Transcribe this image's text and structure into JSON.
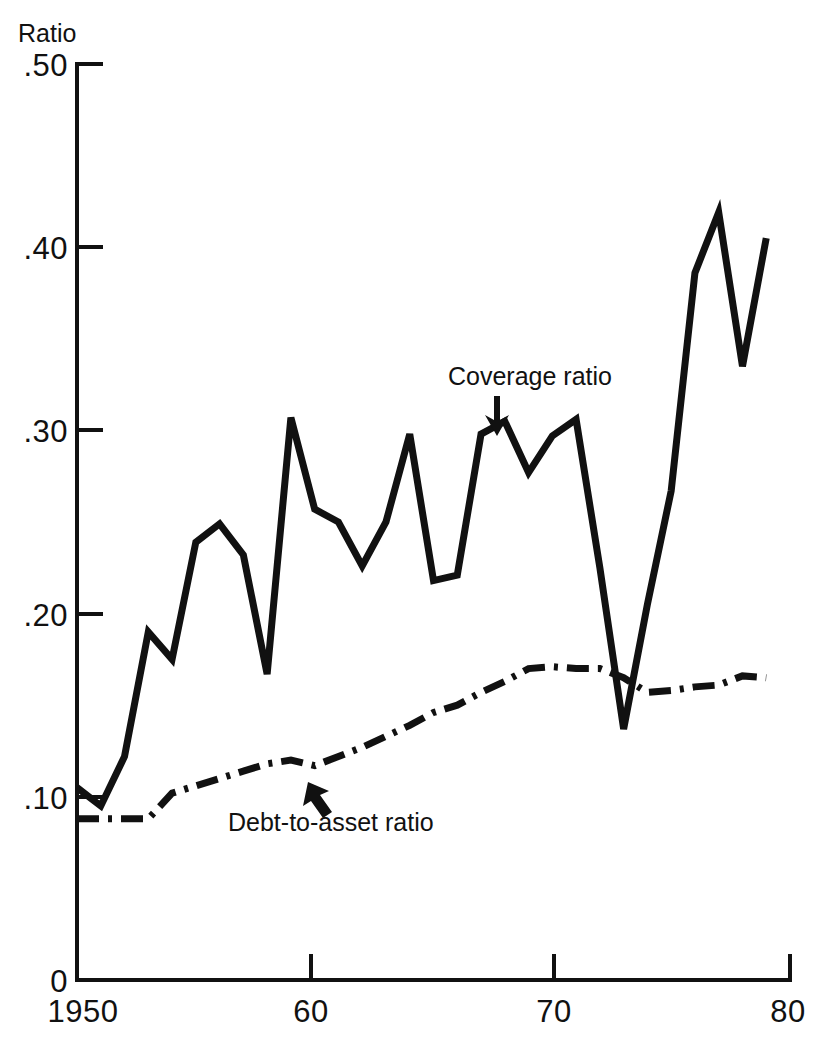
{
  "figure": {
    "y_axis_title": "Ratio",
    "background_color": "#ffffff",
    "ink_color": "#111111"
  },
  "annotations": {
    "coverage": {
      "label": "Coverage ratio",
      "arrow": "arrow-down-icon"
    },
    "debt": {
      "label": "Debt-to-asset ratio",
      "arrow": "arrow-up-left-icon"
    }
  },
  "chart_data": {
    "type": "line",
    "title": "",
    "subtitle": "",
    "xlabel": "",
    "ylabel": "Ratio",
    "xlim": [
      1950,
      1980
    ],
    "ylim": [
      0,
      0.5
    ],
    "grid": false,
    "legend_position": "inline-annotations",
    "x_tick_labels": [
      "1950",
      "60",
      "70",
      "80"
    ],
    "x_tick_values": [
      1950,
      1960,
      1970,
      1980
    ],
    "y_tick_labels": [
      "0",
      ".10",
      ".20",
      ".30",
      ".40",
      ".50"
    ],
    "y_tick_values": [
      0,
      0.1,
      0.2,
      0.3,
      0.4,
      0.5
    ],
    "x": [
      1950,
      1951,
      1952,
      1953,
      1954,
      1955,
      1956,
      1957,
      1958,
      1959,
      1960,
      1961,
      1962,
      1963,
      1964,
      1965,
      1966,
      1967,
      1968,
      1969,
      1970,
      1971,
      1972,
      1973,
      1974,
      1975,
      1976,
      1977,
      1978,
      1979
    ],
    "series": [
      {
        "name": "Coverage ratio",
        "style": "solid",
        "values": [
          0.105,
          0.095,
          0.122,
          0.19,
          0.175,
          0.239,
          0.249,
          0.232,
          0.167,
          0.307,
          0.257,
          0.25,
          0.226,
          0.25,
          0.298,
          0.218,
          0.221,
          0.298,
          0.305,
          0.277,
          0.297,
          0.306,
          0.225,
          0.137,
          0.205,
          0.267,
          0.386,
          0.419,
          0.335,
          0.405
        ]
      },
      {
        "name": "Debt-to-asset ratio",
        "style": "dash-dot",
        "values": [
          0.088,
          0.088,
          0.088,
          0.088,
          0.102,
          0.106,
          0.11,
          0.114,
          0.118,
          0.12,
          0.117,
          0.122,
          0.127,
          0.133,
          0.139,
          0.146,
          0.15,
          0.157,
          0.163,
          0.17,
          0.171,
          0.17,
          0.17,
          0.165,
          0.157,
          0.158,
          0.16,
          0.161,
          0.166,
          0.165
        ]
      }
    ]
  }
}
